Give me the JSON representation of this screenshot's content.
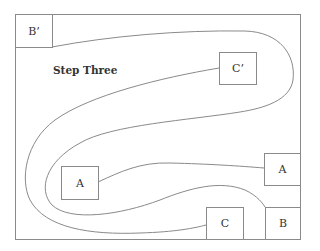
{
  "diagram": {
    "title": "Step Three",
    "nodes": [
      {
        "id": "b-prime",
        "label": "B’"
      },
      {
        "id": "c-prime",
        "label": "C’"
      },
      {
        "id": "a-left",
        "label": "A"
      },
      {
        "id": "a-right",
        "label": "A"
      },
      {
        "id": "c",
        "label": "C"
      },
      {
        "id": "b",
        "label": "B"
      }
    ],
    "connections": [
      {
        "from": "B’",
        "to": "B"
      },
      {
        "from": "C’",
        "to": "C"
      },
      {
        "from": "A",
        "to": "A"
      }
    ],
    "colors": {
      "line": "#8a8a8a",
      "text": "#333333",
      "background": "#ffffff"
    }
  }
}
